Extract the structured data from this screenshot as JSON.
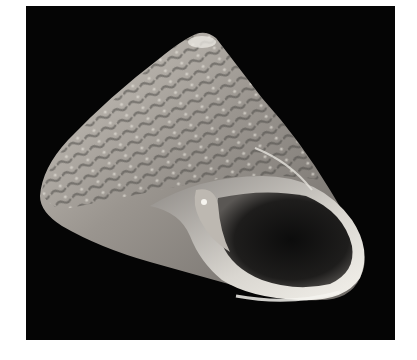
{
  "image": {
    "subject": "top shell (gastropod) on black background",
    "background_color": "#ffffff",
    "frame_color": "#050505",
    "shell_colors": [
      "#d8d4cc",
      "#8a8580",
      "#4a4644",
      "#f2efe8"
    ]
  }
}
